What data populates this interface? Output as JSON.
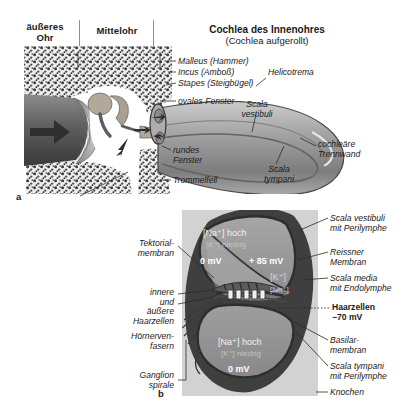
{
  "figure": {
    "panel_a_letter": "a",
    "panel_b_letter": "b"
  },
  "panel_a": {
    "headers": [
      {
        "name": "outer-ear",
        "text": "äußeres\nOhr"
      },
      {
        "name": "middle-ear",
        "text": "Mittelohr"
      }
    ],
    "title": "Cochlea des Innenohres",
    "subtitle": "(Cochlea aufgerollt)",
    "labels": [
      {
        "name": "malleus",
        "text": "Malleus (Hammer)"
      },
      {
        "name": "incus",
        "text": "Incus (Amboß)"
      },
      {
        "name": "stapes",
        "text": "Stapes (Steigbügel)"
      },
      {
        "name": "oval-window",
        "text": "ovales Fenster"
      },
      {
        "name": "round-window",
        "text": "rundes\nFenster"
      },
      {
        "name": "eardrum",
        "text": "Trommelfell"
      },
      {
        "name": "helicotrema",
        "text": "Helicotrema"
      },
      {
        "name": "scala-vestibuli",
        "text": "Scala\nvestibuli"
      },
      {
        "name": "scala-tympani",
        "text": "Scala\ntympani"
      },
      {
        "name": "cochlear-partition",
        "text": "cochleäre\nTrennwand"
      }
    ]
  },
  "panel_b": {
    "left_labels": [
      {
        "name": "tectorial-membrane",
        "text": "Tektorial-\nmembran"
      },
      {
        "name": "hair-cells",
        "text": "innere\nund\näußere\nHaarzellen"
      },
      {
        "name": "auditory-nerve-fibres",
        "text": "Hörnerven-\nfasern"
      },
      {
        "name": "spiral-ganglion",
        "text": "Ganglion\nspirale"
      }
    ],
    "right_labels": [
      {
        "name": "scala-vestibuli-perilymph",
        "text": "Scala vestibuli\nmit Perilymphe",
        "bold": false
      },
      {
        "name": "reissner-membrane",
        "text": "Reissner\nMembran",
        "bold": false
      },
      {
        "name": "scala-media-endolymph",
        "text": "Scala media\nmit Endolymphe",
        "bold": false
      },
      {
        "name": "hair-cells-potential",
        "text": "Haarzellen\n−70 mV",
        "bold": true
      },
      {
        "name": "basilar-membrane",
        "text": "Basilar-\nmembran",
        "bold": false
      },
      {
        "name": "scala-tympani-perilymph",
        "text": "Scala tympani\nmit Perilymphe",
        "bold": false
      },
      {
        "name": "bone",
        "text": "Knochen",
        "bold": false
      }
    ],
    "compartments": [
      {
        "name": "scala-vestibuli",
        "ion_high": "[Na⁺] hoch",
        "ion_low": "[K⁺] niedrig",
        "potential": "0 mV"
      },
      {
        "name": "scala-media",
        "ion_high": "[K⁺]",
        "ion_low": "[Na⁺]",
        "potential": "+ 85 mV"
      },
      {
        "name": "scala-tympani",
        "ion_high": "[Na⁺] hoch",
        "ion_low": "[K⁺] niedrig",
        "potential": "0 mV"
      }
    ]
  },
  "colors": {
    "panel_b_background": "#d2d2d2",
    "tissue_dark": "#4a4a4a",
    "fluid_gray": "#9a9a9a",
    "bone_speckle": "#6e6e6e",
    "text": "#1a1a1a"
  }
}
